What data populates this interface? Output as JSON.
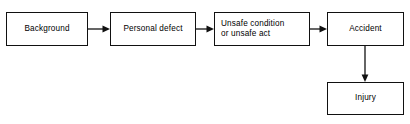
{
  "diagram": {
    "background_color": "#ffffff",
    "line_color": "#111111",
    "text_color": "#000000",
    "nodes": [
      {
        "id": "background",
        "label": "Background",
        "align": "center"
      },
      {
        "id": "personal_defect",
        "label": "Personal defect",
        "align": "center"
      },
      {
        "id": "unsafe",
        "label": "Unsafe condition\nor unsafe act",
        "align": "left"
      },
      {
        "id": "accident",
        "label": "Accident",
        "align": "center"
      },
      {
        "id": "injury",
        "label": "Injury",
        "align": "center"
      }
    ],
    "connectors": [
      {
        "id": "conn_1",
        "from": "background",
        "to": "personal_defect",
        "direction": "right"
      },
      {
        "id": "conn_2",
        "from": "personal_defect",
        "to": "unsafe",
        "direction": "right"
      },
      {
        "id": "conn_3",
        "from": "unsafe",
        "to": "accident",
        "direction": "right"
      },
      {
        "id": "conn_4",
        "from": "accident",
        "to": "injury",
        "direction": "down"
      }
    ]
  }
}
